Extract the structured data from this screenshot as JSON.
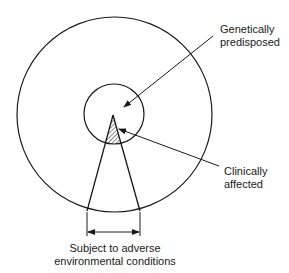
{
  "diagram": {
    "type": "concentric-population-diagram",
    "labels": {
      "genetically_predisposed": [
        "Genetically",
        "predisposed"
      ],
      "clinically_affected": [
        "Clinically",
        "affected"
      ],
      "environmental": [
        "Subject to adverse",
        "environmental conditions"
      ]
    },
    "shapes": {
      "outer_circle": {
        "cx": 114.5,
        "cy": 114.5,
        "r": 97.5,
        "meaning": "whole population"
      },
      "inner_circle": {
        "cx": 114,
        "cy": 114,
        "r": 30,
        "meaning": "genetically predisposed"
      },
      "sector": {
        "apex": [
          113,
          116
        ],
        "base_left": [
          87,
          211
        ],
        "base_right": [
          140,
          211
        ],
        "meaning": "subject to adverse environmental conditions"
      },
      "hatched_overlap": {
        "meaning": "clinically affected"
      }
    },
    "stroke_color": "#1a1a1a",
    "background": "#ffffff"
  }
}
